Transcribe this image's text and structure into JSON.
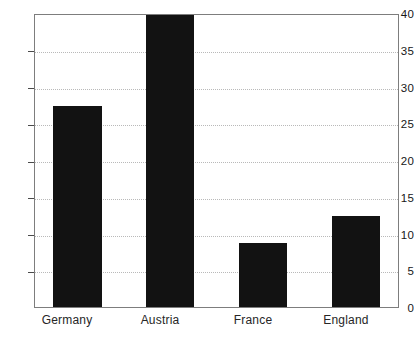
{
  "chart_data": {
    "type": "bar",
    "title": "",
    "subtitle": "",
    "xlabel": "",
    "ylabel": "",
    "categories": [
      "Germany",
      "Austria",
      "France",
      "England"
    ],
    "values": [
      27.6,
      40.0,
      8.8,
      12.5
    ],
    "series": [
      {
        "name": "",
        "values": [
          27.6,
          40.0,
          8.8,
          12.5
        ]
      }
    ],
    "ylim": [
      0,
      40
    ],
    "yticks": [
      0,
      5,
      10,
      15,
      20,
      25,
      30,
      35,
      40
    ],
    "ytick_labels": [
      "0",
      "5",
      "10",
      "15",
      "20",
      "25",
      "30",
      "35",
      "40"
    ],
    "grid": true,
    "grid_axis": "y",
    "grid_style": "dotted",
    "legend": false,
    "legend_position": "none",
    "bar_color": "#121212",
    "axis_color": "#7d7d7d",
    "grid_color": "#b9b9b9",
    "background_color": "#ffffff"
  }
}
